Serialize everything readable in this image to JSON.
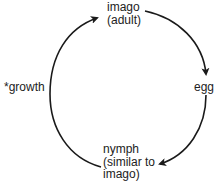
{
  "diagram": {
    "type": "cycle",
    "title": "",
    "nodes": [
      {
        "id": "imago",
        "lines": [
          "imago",
          "(adult)"
        ]
      },
      {
        "id": "egg",
        "lines": [
          "egg"
        ]
      },
      {
        "id": "nymph",
        "lines": [
          "nymph",
          "(similar to",
          "imago)"
        ]
      }
    ],
    "edges": [
      {
        "from": "imago",
        "to": "egg",
        "label": ""
      },
      {
        "from": "egg",
        "to": "nymph",
        "label": ""
      },
      {
        "from": "nymph",
        "to": "imago",
        "label": "*growth"
      }
    ],
    "colors": {
      "stroke": "#1a1a1a",
      "text": "#222222",
      "background": "#ffffff"
    }
  }
}
